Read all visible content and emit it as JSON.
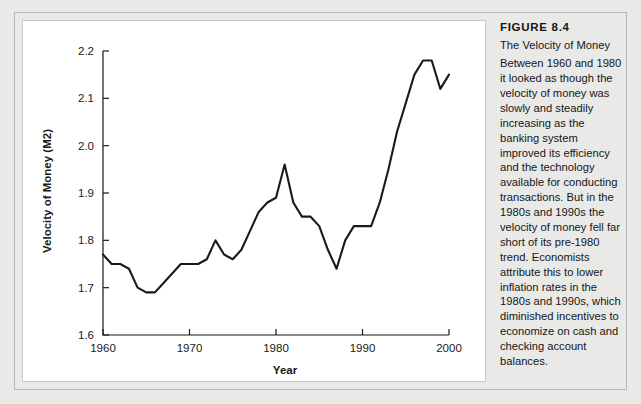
{
  "figure": {
    "number_label": "FIGURE 8.4",
    "subtitle": "The Velocity of Money",
    "body": "Between 1960 and 1980 it looked as though the velocity of money was slowly and steadily increasing as the banking system improved its efficiency and the technology available for conducting transactions. But in the 1980s and 1990s the velocity of money fell far short of its pre-1980 trend. Economists attribute this to lower inflation rates in the 1980s and 1990s, which diminished incentives to economize on cash and checking account balances."
  },
  "colors": {
    "page_background": "#e9e9e7",
    "panel_background": "#ffffff",
    "frame_border": "#b7b7b5",
    "series_line": "#1a1a1a",
    "axis": "#1a1a1a",
    "text": "#16161a"
  },
  "chart_data": {
    "type": "line",
    "title": "",
    "xlabel": "Year",
    "ylabel": "Velocity of Money (M2)",
    "xlim": [
      1960,
      2000
    ],
    "ylim": [
      1.6,
      2.2
    ],
    "xticks": [
      1960,
      1970,
      1980,
      1990,
      2000
    ],
    "xtick_labels": [
      "1960",
      "1970",
      "1980",
      "1990",
      "2000"
    ],
    "yticks": [
      1.6,
      1.7,
      1.8,
      1.9,
      2.0,
      2.1,
      2.2
    ],
    "ytick_labels": [
      "1.6",
      "1.7",
      "1.8",
      "1.9",
      "2.0",
      "2.1",
      "2.2"
    ],
    "grid": false,
    "legend": false,
    "series": [
      {
        "name": "Velocity of Money (M2)",
        "x": [
          1960,
          1961,
          1962,
          1963,
          1964,
          1965,
          1966,
          1967,
          1968,
          1969,
          1970,
          1971,
          1972,
          1973,
          1974,
          1975,
          1976,
          1977,
          1978,
          1979,
          1980,
          1981,
          1982,
          1983,
          1984,
          1985,
          1986,
          1987,
          1988,
          1989,
          1990,
          1991,
          1992,
          1993,
          1994,
          1995,
          1996,
          1997,
          1998,
          1999,
          2000
        ],
        "values": [
          1.77,
          1.75,
          1.75,
          1.74,
          1.7,
          1.69,
          1.69,
          1.71,
          1.73,
          1.75,
          1.75,
          1.75,
          1.76,
          1.8,
          1.77,
          1.76,
          1.78,
          1.82,
          1.86,
          1.88,
          1.89,
          1.96,
          1.88,
          1.85,
          1.85,
          1.83,
          1.78,
          1.74,
          1.8,
          1.83,
          1.83,
          1.83,
          1.88,
          1.95,
          2.03,
          2.09,
          2.15,
          2.18,
          2.18,
          2.12,
          2.15
        ]
      }
    ]
  }
}
